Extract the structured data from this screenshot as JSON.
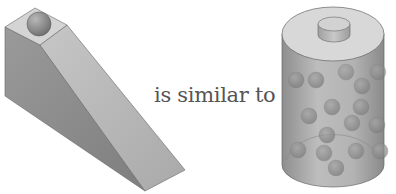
{
  "diagram": {
    "type": "analogy",
    "left_figure": {
      "name": "ramp-with-ball",
      "description": "Inclined wedge (ramp) with a ball resting at its top"
    },
    "connector_text": "is similar to",
    "right_figure": {
      "name": "battery-with-charges",
      "description": "Cylindrical battery cell with a terminal cap, filled with spheres",
      "sphere_count": 17
    },
    "colors": {
      "ramp_side": "#8f8f8f",
      "ramp_slope": "#b9b9b9",
      "ramp_top": "#d4d4d4",
      "ball": "#8a8a8a",
      "cylinder_body": "#b0b0b0",
      "cylinder_top": "#d8d8d8",
      "text": "#555555"
    }
  }
}
